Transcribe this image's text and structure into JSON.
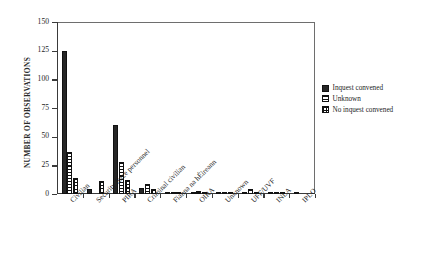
{
  "chart_data": {
    "type": "bar",
    "title": "",
    "xlabel": "",
    "ylabel": "NUMBER OF OBSERVATIONS",
    "ylim": [
      0,
      150
    ],
    "yticks": [
      0,
      25,
      50,
      75,
      100,
      125,
      150
    ],
    "ytick_labels": [
      "0",
      "25",
      "50",
      "75",
      "100",
      "125",
      "150"
    ],
    "grid": false,
    "legend_position": "right",
    "categories": [
      "Civilian",
      "Security force personnel",
      "PIRA",
      "Criminal civilian",
      "Fianna na hÉireann",
      "OIRA",
      "Unknown",
      "UFF/UVF",
      "INLA",
      "IPLO"
    ],
    "series": [
      {
        "name": "Inquest convened",
        "fill": "solid",
        "values": [
          125,
          4,
          60,
          5,
          1,
          1,
          1,
          1,
          2,
          1
        ]
      },
      {
        "name": "Unknown",
        "fill": "horizontal-stripes",
        "values": [
          37,
          0,
          28,
          9,
          1,
          3,
          1,
          4,
          2,
          0
        ]
      },
      {
        "name": "No inquest convened",
        "fill": "checkered",
        "values": [
          14,
          11,
          12,
          4,
          1,
          1,
          1,
          1,
          1,
          0
        ]
      }
    ]
  },
  "legend": {
    "items": [
      {
        "label": "Inquest convened",
        "fill": "solid"
      },
      {
        "label": "Unknown",
        "fill": "horizontal-stripes"
      },
      {
        "label": "No inquest convened",
        "fill": "checkered"
      }
    ]
  }
}
